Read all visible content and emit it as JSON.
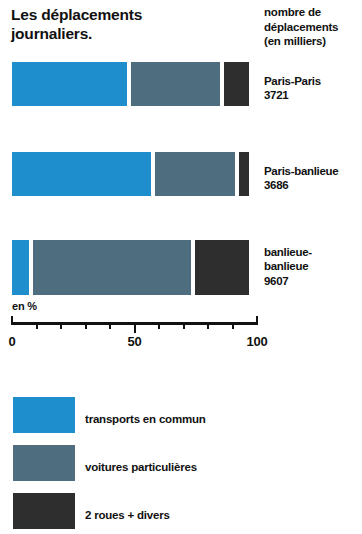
{
  "title": {
    "line1": "Les déplacements",
    "line2": "journaliers."
  },
  "value_column_header": {
    "line1": "nombre de",
    "line2": "déplacements",
    "line3": "(en milliers)"
  },
  "axis": {
    "unit_label": "en %",
    "tick_labels": [
      "0",
      "50",
      "100"
    ],
    "tick_values": [
      0,
      50,
      100
    ],
    "minor_step": 10,
    "min": 0,
    "max": 100
  },
  "legend": {
    "items": [
      {
        "label": "transports en commun",
        "color": "#1f8ecd",
        "key": "public"
      },
      {
        "label": "voitures particulières",
        "color": "#4e6e80",
        "key": "car"
      },
      {
        "label": "2 roues + divers",
        "color": "#2e2e2e",
        "key": "other"
      }
    ]
  },
  "rows": [
    {
      "name_line1": "Paris-Paris",
      "name_line2": "",
      "value": "3721",
      "public": 48.6,
      "car": 38.0,
      "other": 10.2
    },
    {
      "name_line1": "Paris-banlieue",
      "name_line2": "",
      "value": "3686",
      "public": 58.4,
      "car": 34.3,
      "other": 4.1
    },
    {
      "name_line1": "banlieue-",
      "name_line2": "banlieue",
      "value": "9607",
      "public": 8.6,
      "car": 66.1,
      "other": 22.0
    }
  ],
  "chart_data": {
    "type": "bar",
    "orientation": "horizontal",
    "stacked": true,
    "normalized": true,
    "title": "Les déplacements journaliers.",
    "subtitle": "",
    "xlabel": "en %",
    "ylabel": "",
    "xlim": [
      0,
      100
    ],
    "xticks": [
      0,
      50,
      100
    ],
    "xtick_labels": [
      "0",
      "50",
      "100"
    ],
    "minor_tick_step": 10,
    "grid": false,
    "legend_position": "bottom-left",
    "categories": [
      "Paris-Paris",
      "Paris-banlieue",
      "banlieue-banlieue"
    ],
    "series": [
      {
        "name": "transports en commun",
        "color": "#1f8ecd",
        "values": [
          48.6,
          58.4,
          8.6
        ]
      },
      {
        "name": "voitures particulières",
        "color": "#4e6e80",
        "values": [
          38.0,
          34.3,
          66.1
        ]
      },
      {
        "name": "2 roues + divers",
        "color": "#2e2e2e",
        "values": [
          10.2,
          4.1,
          22.0
        ]
      }
    ],
    "annotations": [
      {
        "category": "Paris-Paris",
        "label": "nombre de déplacements (en milliers)",
        "value": 3721
      },
      {
        "category": "Paris-banlieue",
        "label": "nombre de déplacements (en milliers)",
        "value": 3686
      },
      {
        "category": "banlieue-banlieue",
        "label": "nombre de déplacements (en milliers)",
        "value": 9607
      }
    ]
  }
}
